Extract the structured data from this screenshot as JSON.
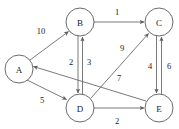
{
  "diagram": {
    "type": "directed-weighted-graph",
    "colors": {
      "background": "#ffffff",
      "node_stroke": "#5a5a5a",
      "node_fill": "#ffffff",
      "edge_stroke": "#6b6b6b",
      "label_text": "#222222",
      "weight_text": "#1a1a1a"
    },
    "nodes": [
      {
        "id": "A",
        "label": "A",
        "cx": 19,
        "cy": 69,
        "r": 14
      },
      {
        "id": "B",
        "label": "B",
        "cx": 80,
        "cy": 22,
        "r": 14
      },
      {
        "id": "C",
        "label": "C",
        "cx": 159,
        "cy": 22,
        "r": 14
      },
      {
        "id": "D",
        "label": "D",
        "cx": 80,
        "cy": 108,
        "r": 14
      },
      {
        "id": "E",
        "label": "E",
        "cx": 159,
        "cy": 108,
        "r": 14
      }
    ],
    "edges": [
      {
        "id": "A-B",
        "from": "A",
        "to": "B",
        "weight": "10",
        "lx": 41,
        "ly": 31
      },
      {
        "id": "B-C",
        "from": "B",
        "to": "C",
        "weight": "1",
        "lx": 117,
        "ly": 12
      },
      {
        "id": "B-D",
        "from": "B",
        "to": "D",
        "weight": "2",
        "lx": 71,
        "ly": 62
      },
      {
        "id": "D-B",
        "from": "D",
        "to": "B",
        "weight": "3",
        "lx": 89,
        "ly": 62
      },
      {
        "id": "A-D",
        "from": "A",
        "to": "D",
        "weight": "5",
        "lx": 42,
        "ly": 100
      },
      {
        "id": "D-E",
        "from": "D",
        "to": "E",
        "weight": "2",
        "lx": 117,
        "ly": 121
      },
      {
        "id": "D-C",
        "from": "D",
        "to": "C",
        "weight": "9",
        "lx": 122,
        "ly": 48
      },
      {
        "id": "E-A",
        "from": "E",
        "to": "A",
        "weight": "7",
        "lx": 119,
        "ly": 78
      },
      {
        "id": "C-E",
        "from": "C",
        "to": "E",
        "weight": "4",
        "lx": 150,
        "ly": 66
      },
      {
        "id": "E-C",
        "from": "E",
        "to": "C",
        "weight": "6",
        "lx": 169,
        "ly": 66
      }
    ]
  }
}
